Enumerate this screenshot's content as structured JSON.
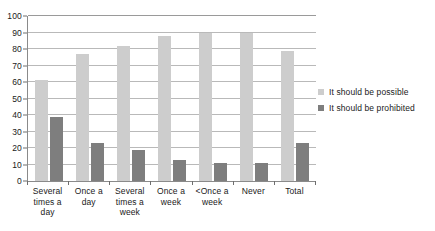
{
  "chart_data": {
    "type": "bar",
    "title": "",
    "subtitle": "",
    "xlabel": "",
    "ylabel": "",
    "ylim": [
      0,
      100
    ],
    "yticks": [
      0,
      10,
      20,
      30,
      40,
      50,
      60,
      70,
      80,
      90,
      100
    ],
    "grid": true,
    "legend_position": "right",
    "categories": [
      "Several times a day",
      "Once a day",
      "Several times a week",
      "Once a week",
      "<Once a week",
      "Never",
      "Total"
    ],
    "series": [
      {
        "name": "It should be possible",
        "color": "#cdcdcd",
        "values": [
          61,
          77,
          82,
          88,
          90,
          90,
          79
        ]
      },
      {
        "name": "It should be prohibited",
        "color": "#7e7e7e",
        "values": [
          39,
          23,
          19,
          13,
          11,
          11,
          23
        ]
      }
    ]
  },
  "colors": {
    "possible": "#cdcdcd",
    "prohibited": "#7e7e7e",
    "gridline": "#b9b9b9",
    "axis": "#8a8a8a",
    "text": "#1a1a1a",
    "background": "#ffffff"
  }
}
